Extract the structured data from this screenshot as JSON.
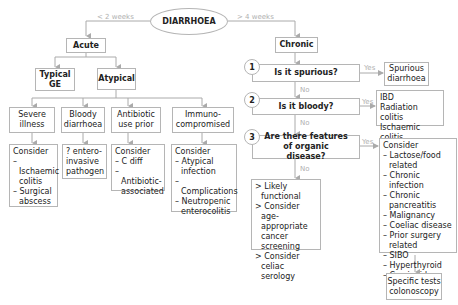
{
  "root": {
    "label": "DIARRHOEA"
  },
  "branches": {
    "acute_label": "< 2  weeks",
    "chronic_label": "> 4 weeks"
  },
  "acute": {
    "title": "Acute",
    "typical": "Typical GE",
    "atypical": "Atypical",
    "categories": [
      {
        "label": "Severe illness",
        "result_title": "Consider",
        "result_items": [
          "– Ischaemic colitis",
          "– Surgical abscess"
        ]
      },
      {
        "label": "Bloody diarrhoea",
        "result_title": "",
        "result_items": [
          "? entero-invasive pathogen"
        ]
      },
      {
        "label": "Antibiotic use prior",
        "result_title": "Consider",
        "result_items": [
          "– C diff",
          "– Antibiotic-associated"
        ]
      },
      {
        "label": "Immuno-compromised",
        "result_title": "Consider",
        "result_items": [
          "– Atypical infection",
          "– Complications",
          "– Neutropenic enterocolitis"
        ]
      }
    ]
  },
  "chronic": {
    "title": "Chronic",
    "yes_label": "Yes",
    "no_label": "No",
    "questions": [
      {
        "num": "1",
        "text": "Is it spurious?",
        "yes_result": [
          "Spurious diarrhoea"
        ]
      },
      {
        "num": "2",
        "text": "Is it bloody?",
        "yes_result": [
          "IBD",
          "Radiation colitis",
          "Ischaemic colitis"
        ]
      },
      {
        "num": "3",
        "text": "Are there features of organic disease?",
        "yes_result_title": "Consider",
        "yes_result": [
          "– Lactose/food related",
          "– Chronic infection",
          "– Chronic pancreatitis",
          "– Malignancy",
          "– Coeliac disease",
          "– Prior surgery related",
          "– SIBO",
          "– Hyperthyroid",
          "– Carcinoid"
        ]
      }
    ],
    "no_result": [
      "> Likely functional",
      "> Consider age-appropriate cancer screening",
      "> Consider celiac serology"
    ],
    "final": "Specific tests colonoscopy"
  }
}
